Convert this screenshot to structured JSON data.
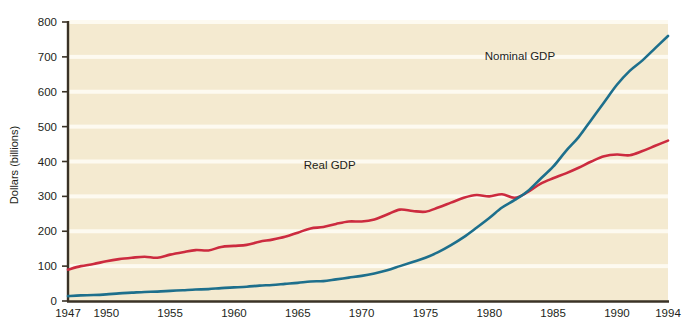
{
  "chart_data": {
    "type": "line",
    "title": "",
    "xlabel": "",
    "ylabel": "Dollars (billions)",
    "xlim": [
      1947,
      1994
    ],
    "ylim": [
      0,
      800
    ],
    "yticks": [
      0,
      100,
      200,
      300,
      400,
      500,
      600,
      700,
      800
    ],
    "xticks": [
      1947,
      1950,
      1955,
      1960,
      1965,
      1970,
      1975,
      1980,
      1985,
      1990,
      1994
    ],
    "grid": "horizontal-white-bands",
    "legend": "inline-labels",
    "plot_background": "#f4ead0",
    "series": [
      {
        "name": "Nominal GDP",
        "color": "#1d6f8c",
        "label_x": 1982.4,
        "label_y": 690,
        "x": [
          1947,
          1948,
          1949,
          1950,
          1951,
          1952,
          1953,
          1954,
          1955,
          1956,
          1957,
          1958,
          1959,
          1960,
          1961,
          1962,
          1963,
          1964,
          1965,
          1966,
          1967,
          1968,
          1969,
          1970,
          1971,
          1972,
          1973,
          1974,
          1975,
          1976,
          1977,
          1978,
          1979,
          1980,
          1981,
          1982,
          1983,
          1984,
          1985,
          1986,
          1987,
          1988,
          1989,
          1990,
          1991,
          1992,
          1993,
          1994
        ],
        "values": [
          14,
          16,
          17,
          19,
          22,
          24,
          26,
          27,
          29,
          31,
          33,
          34,
          37,
          39,
          41,
          44,
          46,
          49,
          52,
          56,
          57,
          62,
          67,
          72,
          79,
          88,
          100,
          112,
          124,
          140,
          160,
          183,
          210,
          238,
          268,
          290,
          315,
          350,
          385,
          430,
          470,
          520,
          570,
          620,
          660,
          690,
          725,
          760
        ]
      },
      {
        "name": "Real GDP",
        "color": "#cc2b3f",
        "label_x": 1967.5,
        "label_y": 378,
        "x": [
          1947,
          1948,
          1949,
          1950,
          1951,
          1952,
          1953,
          1954,
          1955,
          1956,
          1957,
          1958,
          1959,
          1960,
          1961,
          1962,
          1963,
          1964,
          1965,
          1966,
          1967,
          1968,
          1969,
          1970,
          1971,
          1972,
          1973,
          1974,
          1975,
          1976,
          1977,
          1978,
          1979,
          1980,
          1981,
          1982,
          1983,
          1984,
          1985,
          1986,
          1987,
          1988,
          1989,
          1990,
          1991,
          1992,
          1993,
          1994
        ],
        "values": [
          90,
          100,
          106,
          114,
          120,
          124,
          127,
          124,
          133,
          140,
          146,
          145,
          155,
          158,
          161,
          170,
          176,
          184,
          196,
          208,
          212,
          221,
          228,
          228,
          234,
          248,
          262,
          258,
          256,
          268,
          282,
          296,
          304,
          300,
          306,
          296,
          312,
          336,
          352,
          366,
          382,
          400,
          415,
          420,
          418,
          430,
          445,
          460
        ]
      }
    ]
  },
  "axis": {
    "y_title": "Dollars (billions)",
    "y_tick_labels": [
      "0",
      "100",
      "200",
      "300",
      "400",
      "500",
      "600",
      "700",
      "800"
    ],
    "x_tick_labels": [
      "1947",
      "1950",
      "1955",
      "1960",
      "1965",
      "1970",
      "1975",
      "1980",
      "1985",
      "1990",
      "1994"
    ]
  },
  "labels": {
    "nominal": "Nominal GDP",
    "real": "Real GDP"
  },
  "colors": {
    "nominal_line": "#1d6f8c",
    "real_line": "#cc2b3f",
    "plot_bg": "#f4ead0",
    "axis": "#3a3226",
    "grid": "#fdfaf0",
    "text": "#231f20"
  }
}
